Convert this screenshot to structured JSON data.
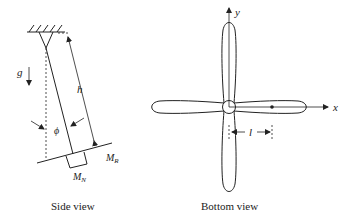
{
  "side_view": {
    "caption": "Side view",
    "gravity_label": "g",
    "height_label": "h",
    "angle_label": "ϕ",
    "rotor_mass_label": "M",
    "rotor_mass_sub": "R",
    "nacelle_mass_label": "M",
    "nacelle_mass_sub": "N"
  },
  "bottom_view": {
    "caption": "Bottom view",
    "x_axis_label": "x",
    "y_axis_label": "y",
    "length_label": "l",
    "blade_count": 4
  }
}
